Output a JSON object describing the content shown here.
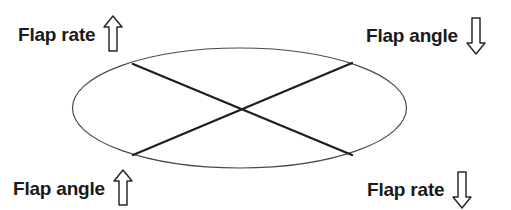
{
  "figure": {
    "type": "schematic-diagram",
    "shape": {
      "name": "ellipse-outline",
      "stroke_color": "#4a4a4a",
      "fill_color": "#ffffff",
      "cx": 239.5,
      "cy": 108,
      "rx": 167,
      "ry": 60
    },
    "diagonals": {
      "name": "crossed-axes",
      "stroke_color": "#1f1f1f",
      "lines": [
        {
          "name": "diagonal-upleft-to-downright",
          "x1": 133,
          "y1": 64,
          "x2": 352,
          "y2": 155
        },
        {
          "name": "diagonal-upright-to-downleft",
          "x1": 352,
          "y1": 63,
          "x2": 133,
          "y2": 155
        }
      ]
    },
    "labels": [
      {
        "position": "top-left",
        "text": "Flap rate",
        "arrow": "arrow-up",
        "arrow_direction": "up",
        "arrow_style": "hollow-outline"
      },
      {
        "position": "top-right",
        "text": "Flap angle",
        "arrow": "arrow-down",
        "arrow_direction": "down",
        "arrow_style": "hollow-outline"
      },
      {
        "position": "bottom-left",
        "text": "Flap angle",
        "arrow": "arrow-up",
        "arrow_direction": "up",
        "arrow_style": "hollow-outline"
      },
      {
        "position": "bottom-right",
        "text": "Flap rate",
        "arrow": "arrow-down",
        "arrow_direction": "down",
        "arrow_style": "hollow-outline"
      }
    ],
    "colors": {
      "text": "#1a1a1a",
      "ellipse_stroke": "#4a4a4a",
      "diagonal_stroke": "#1f1f1f",
      "arrow_stroke": "#2a2a2a",
      "background": "#ffffff"
    }
  }
}
